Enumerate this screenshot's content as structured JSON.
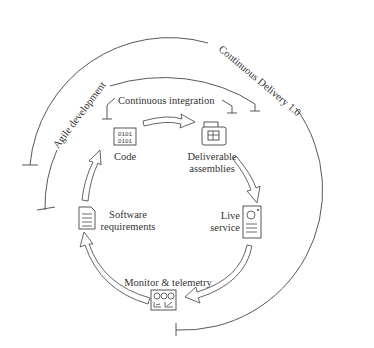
{
  "diagram": {
    "type": "cycle",
    "phases": {
      "outer": "Continuous Delivery 1.0",
      "middle": "Agile development",
      "inner": "Continuous integration"
    },
    "nodes": [
      {
        "id": "code",
        "label": "Code",
        "icon": "binary-code-icon"
      },
      {
        "id": "deliverable",
        "label_line1": "Deliverable",
        "label_line2": "assemblies",
        "icon": "package-box-icon"
      },
      {
        "id": "live",
        "label_line1": "Live",
        "label_line2": "service",
        "icon": "server-icon"
      },
      {
        "id": "monitor",
        "label": "Monitor & telemetry",
        "icon": "dashboard-gauges-icon"
      },
      {
        "id": "requirements",
        "label_line1": "Software",
        "label_line2": "requirements",
        "icon": "document-icon"
      }
    ],
    "flow": [
      "code",
      "deliverable",
      "live",
      "monitor",
      "requirements",
      "code"
    ]
  }
}
